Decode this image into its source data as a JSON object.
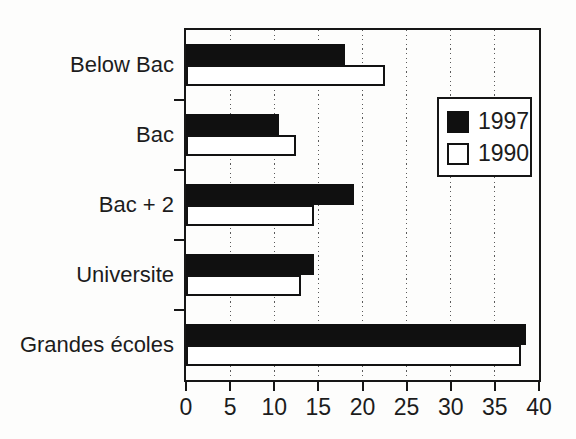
{
  "figure": {
    "background_color": "#fdfdfc",
    "ink_color": "#121212"
  },
  "chart_data": {
    "type": "bar",
    "orientation": "horizontal",
    "title": "",
    "xlabel": "",
    "ylabel": "",
    "categories": [
      "Below Bac",
      "Bac",
      "Bac + 2",
      "Universite",
      "Grandes écoles"
    ],
    "series": [
      {
        "name": "1997",
        "style": "filled",
        "color": "#101010",
        "values": [
          18,
          10.5,
          19,
          14.5,
          38.5
        ]
      },
      {
        "name": "1990",
        "style": "open",
        "color": "#ffffff",
        "values": [
          22.5,
          12.5,
          14.5,
          13,
          38
        ]
      }
    ],
    "x_axis": {
      "min": 0,
      "max": 40,
      "tick_step": 5,
      "ticks": [
        0,
        5,
        10,
        15,
        20,
        25,
        30,
        35,
        40
      ]
    },
    "grid": {
      "vertical": true,
      "line_style": "dotted"
    },
    "legend": {
      "position": "upper-right",
      "border": true
    }
  }
}
